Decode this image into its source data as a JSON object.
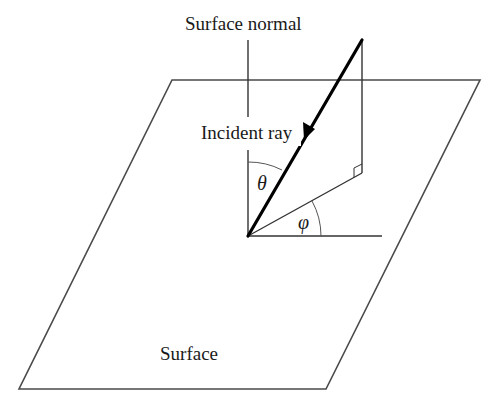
{
  "diagram": {
    "labels": {
      "surface_normal": "Surface normal",
      "incident_ray": "Incident ray",
      "surface": "Surface",
      "theta": "θ",
      "phi": "φ"
    },
    "colors": {
      "background": "#ffffff",
      "line": "#333333",
      "ray": "#000000",
      "text": "#1a1a1a"
    },
    "geometry": {
      "surface_plane_corners": [
        [
          172,
          80
        ],
        [
          480,
          80
        ],
        [
          326,
          389
        ],
        [
          19,
          389
        ]
      ],
      "origin": [
        248,
        236
      ],
      "ray_start": [
        362,
        40
      ],
      "projection_foot": [
        362,
        173
      ],
      "normal_top": [
        248,
        40
      ],
      "azimuth_reference_end": [
        382,
        236
      ]
    },
    "annotations": {
      "right_angle_marker_at": "projection_foot",
      "theta_between": [
        "surface_normal",
        "incident_ray"
      ],
      "phi_between": [
        "azimuth_reference",
        "ray_projection"
      ]
    }
  }
}
